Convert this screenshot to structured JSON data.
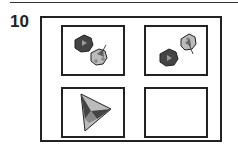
{
  "question": {
    "number": "10"
  },
  "puzzle": {
    "cells": [
      {
        "position": "top-left",
        "content": "dark-heptagon-with-triangle-and-light-heptagon-with-arrow"
      },
      {
        "position": "top-right",
        "content": "light-heptagon-with-arrow-and-dark-heptagon-with-triangle"
      },
      {
        "position": "bottom-left",
        "content": "triangle-composite"
      },
      {
        "position": "bottom-right",
        "content": "empty"
      }
    ],
    "colors": {
      "dark": "#444444",
      "light": "#bbbbbb",
      "stroke": "#222222"
    }
  }
}
